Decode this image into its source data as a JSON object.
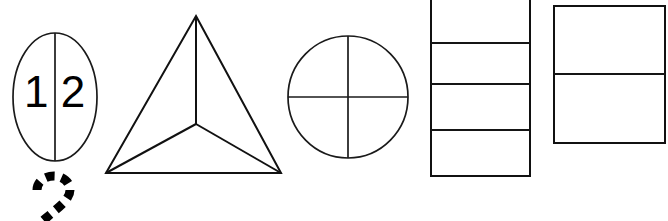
{
  "worksheet": {
    "canvas": {
      "width": 668,
      "height": 221,
      "background": "#ffffff",
      "ink": "#111111"
    },
    "oval": {
      "label": "oval-split-in-two",
      "parts": 2,
      "left_numeral": "1",
      "right_numeral": "2",
      "cx": 55,
      "cy": 97,
      "rx": 42,
      "ry": 64,
      "divider": "vertical"
    },
    "triangle": {
      "label": "triangle-split-in-three",
      "parts": 3,
      "apex_x": 196,
      "apex_y": 16,
      "left_x": 106,
      "left_y": 173,
      "right_x": 281,
      "right_y": 173,
      "center_x": 196,
      "center_y": 124
    },
    "circle": {
      "label": "circle-split-in-four",
      "parts": 4,
      "cx": 348,
      "cy": 97,
      "rx": 60,
      "ry": 61,
      "dividers": [
        "vertical",
        "horizontal"
      ]
    },
    "tall_rectangle": {
      "label": "rectangle-split-in-four",
      "parts": 4,
      "x": 431,
      "y": -3,
      "width": 99,
      "height": 179,
      "divider_y": [
        43,
        84,
        130
      ],
      "top_edge_cropped": true
    },
    "wide_rectangle": {
      "label": "rectangle-split-in-two",
      "parts": 2,
      "x": 554,
      "y": 6,
      "width": 111,
      "height": 137,
      "divider_y": [
        74
      ]
    },
    "trace_numeral": {
      "label": "dotted-tracing-numeral-two",
      "value": "2",
      "style": "dashed-outline",
      "x": 30,
      "y": 176,
      "bottom_cropped": true
    }
  }
}
